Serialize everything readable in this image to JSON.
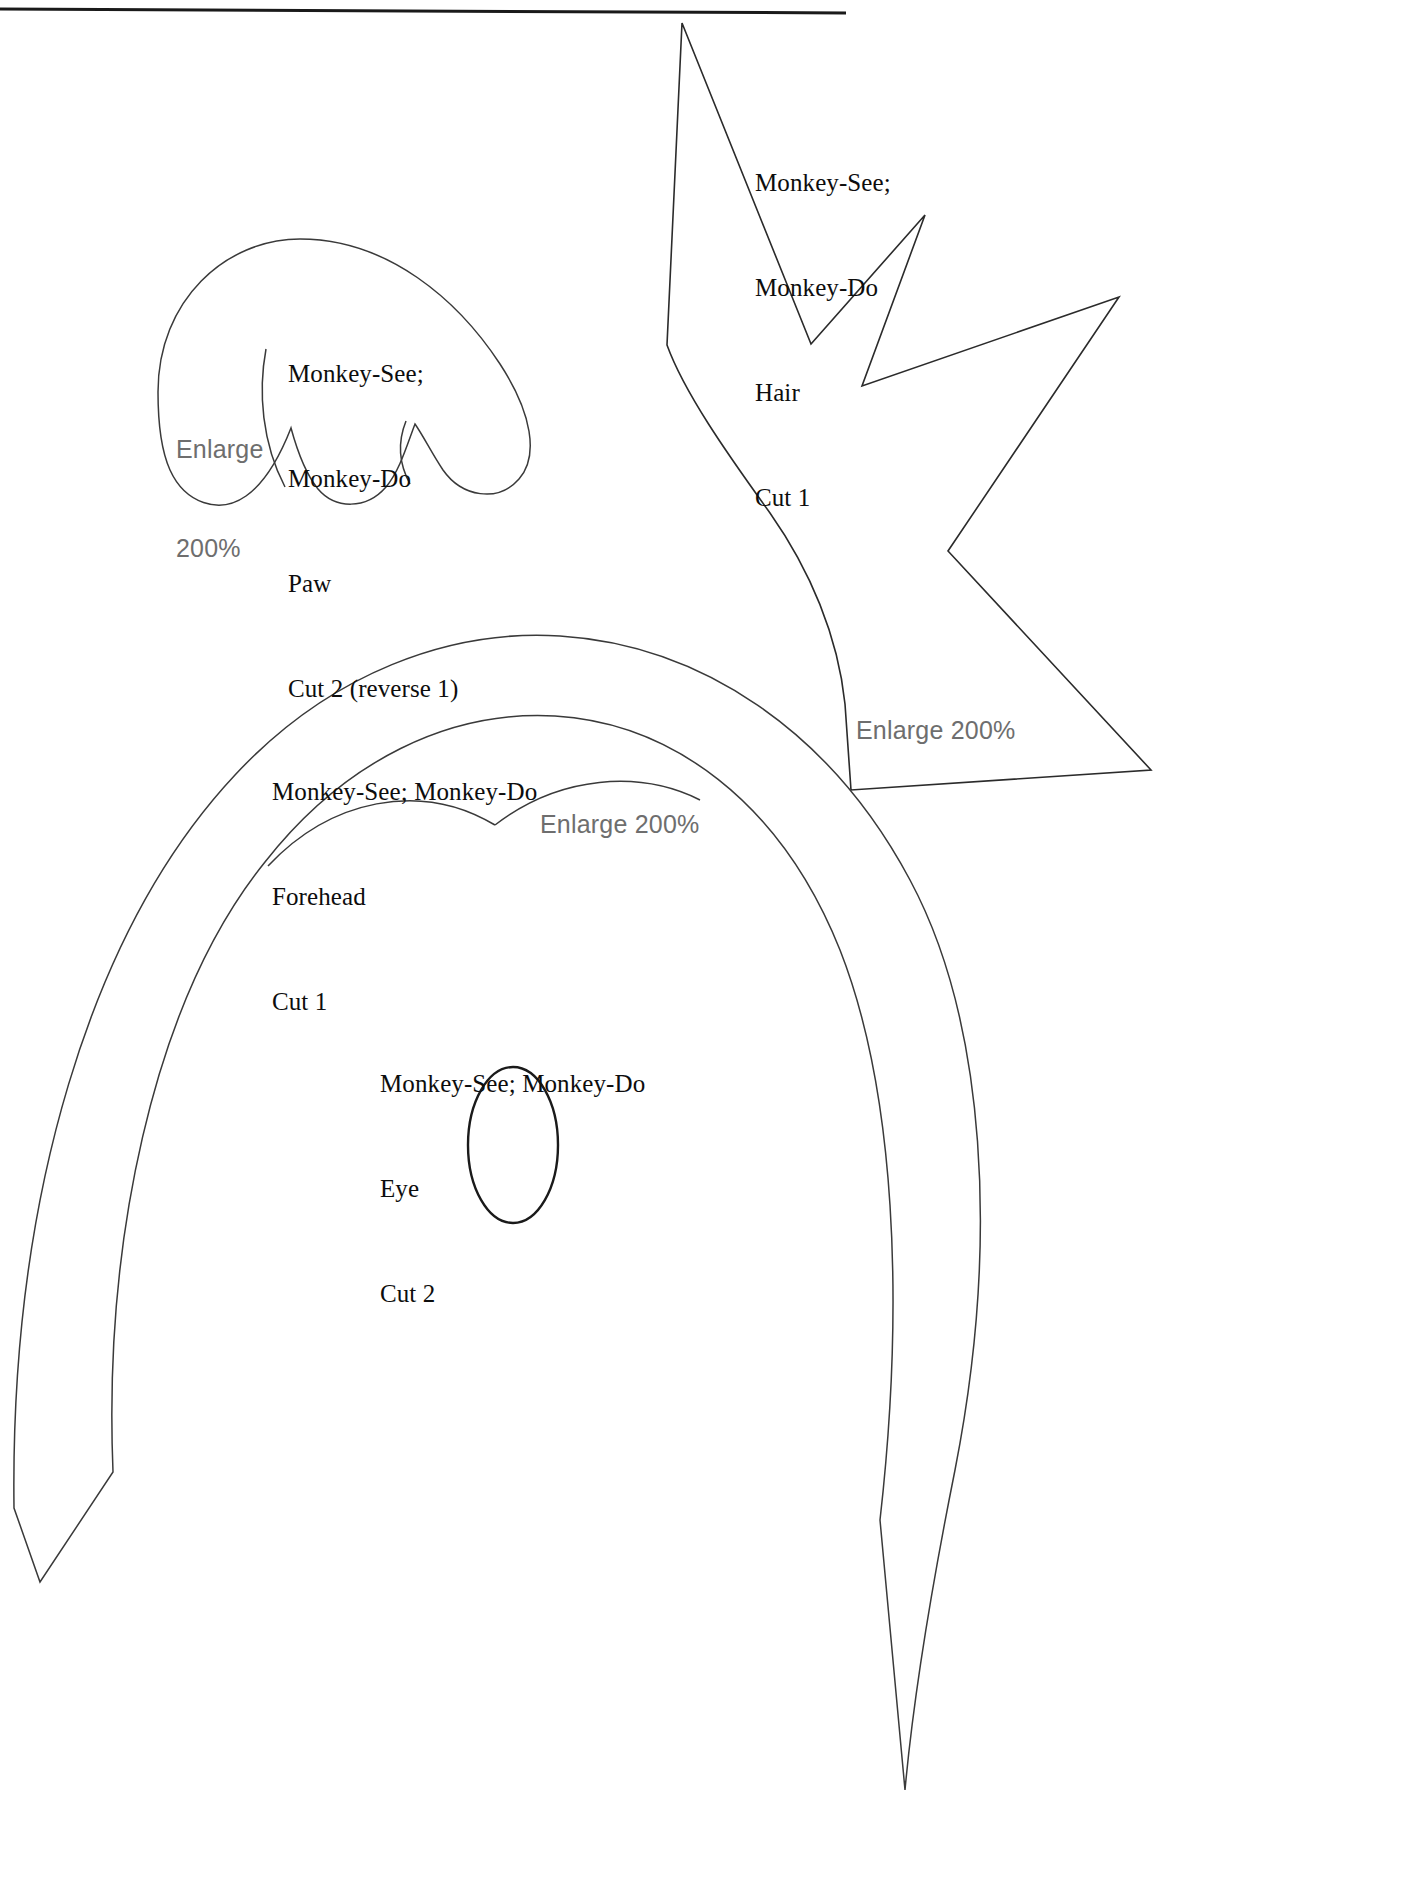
{
  "document": {
    "title": "Monkey-See; Monkey-Do Pattern Sheet",
    "top_rule": "horizontal-rule"
  },
  "pieces": [
    {
      "id": "hair",
      "name": "hair-pattern-piece",
      "label_lines": [
        "Monkey-See;",
        "Monkey-Do",
        "Hair",
        "Cut 1"
      ],
      "cut_count": "Cut 1",
      "part_name": "Hair"
    },
    {
      "id": "paw",
      "name": "paw-pattern-piece",
      "label_lines": [
        "Monkey-See;",
        "Monkey-Do",
        "Paw",
        "Cut 2 (reverse 1)"
      ],
      "cut_count": "Cut 2 (reverse 1)",
      "part_name": "Paw"
    },
    {
      "id": "forehead",
      "name": "forehead-pattern-piece",
      "label_lines": [
        "Monkey-See; Monkey-Do",
        "Forehead",
        "Cut 1"
      ],
      "cut_count": "Cut 1",
      "part_name": "Forehead"
    },
    {
      "id": "eye",
      "name": "eye-pattern-piece",
      "label_lines": [
        "Monkey-See; Monkey-Do",
        "Eye",
        "Cut 2"
      ],
      "cut_count": "Cut 2",
      "part_name": "Eye"
    }
  ],
  "labels": {
    "hair": {
      "line1": "Monkey-See;",
      "line2": "Monkey-Do",
      "line3": "Hair",
      "line4": "Cut 1"
    },
    "paw": {
      "line1": "Monkey-See;",
      "line2": "Monkey-Do",
      "line3": "Paw",
      "line4": "Cut 2 (reverse 1)"
    },
    "forehead": {
      "line1": "Monkey-See; Monkey-Do",
      "line2": "Forehead",
      "line3": "Cut 1"
    },
    "eye": {
      "line1": "Monkey-See; Monkey-Do",
      "line2": "Eye",
      "line3": "Cut 2"
    }
  },
  "enlarge_notes": {
    "paw": {
      "line1": "Enlarge",
      "line2": "200%"
    },
    "hair": {
      "text": "Enlarge 200%"
    },
    "forehead": {
      "text": "Enlarge 200%"
    }
  },
  "colors": {
    "outline": "#2b2b2b",
    "label_text": "#0d0d0d",
    "enlarge_text": "#6e6e6e",
    "background": "#ffffff",
    "rule": "#1a1a1a"
  },
  "icons": {
    "hair_shape": "zigzag-crown-outline-icon",
    "paw_shape": "paw-lobes-outline-icon",
    "forehead_shape": "arched-band-outline-icon",
    "eye_shape": "ellipse-outline-icon"
  }
}
